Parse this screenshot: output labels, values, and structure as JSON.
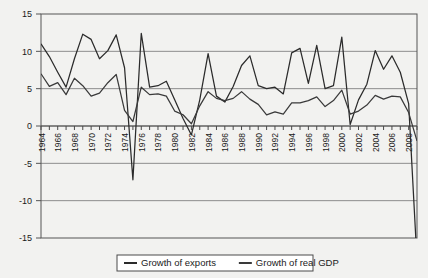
{
  "chart_data": {
    "type": "line",
    "title": "",
    "xlabel": "",
    "ylabel": "",
    "ylim": [
      -15,
      15
    ],
    "xlim": [
      1964,
      2009
    ],
    "grid": true,
    "legend_position": "bottom",
    "y_ticks": [
      "15",
      "10",
      "5",
      "0",
      "-5",
      "-10",
      "-15"
    ],
    "y_tick_values": [
      15,
      10,
      5,
      0,
      -5,
      -10,
      -15
    ],
    "x_tick_labels": [
      "1964",
      "1966",
      "1968",
      "1970",
      "1972",
      "1974",
      "1976",
      "1978",
      "1980",
      "1982",
      "1984",
      "1986",
      "1988",
      "1990",
      "1992",
      "1994",
      "1996",
      "1998",
      "2000",
      "2002",
      "2004",
      "2006",
      "2008"
    ],
    "x": [
      1964,
      1965,
      1966,
      1967,
      1968,
      1969,
      1970,
      1971,
      1972,
      1973,
      1974,
      1975,
      1976,
      1977,
      1978,
      1979,
      1980,
      1981,
      1982,
      1983,
      1984,
      1985,
      1986,
      1987,
      1988,
      1989,
      1990,
      1991,
      1992,
      1993,
      1994,
      1995,
      1996,
      1997,
      1998,
      1999,
      2000,
      2001,
      2002,
      2003,
      2004,
      2005,
      2006,
      2007,
      2008,
      2009
    ],
    "series": [
      {
        "name": "Growth of exports",
        "color": "#2b2b2b",
        "values": [
          11.0,
          9.3,
          7.2,
          5.2,
          9.0,
          12.3,
          11.6,
          9.0,
          10.1,
          12.2,
          7.8,
          -7.2,
          12.4,
          5.2,
          5.4,
          6.0,
          3.5,
          1.0,
          -1.2,
          3.5,
          9.7,
          4.0,
          3.2,
          5.3,
          8.1,
          9.4,
          5.4,
          5.0,
          5.2,
          4.3,
          9.8,
          10.4,
          5.7,
          10.8,
          5.0,
          5.4,
          11.9,
          0.2,
          3.5,
          5.6,
          10.1,
          7.6,
          9.4,
          7.2,
          3.0,
          -18.0
        ]
      },
      {
        "name": "Growth of real GDP",
        "color": "#3a3a3a",
        "values": [
          7.0,
          5.3,
          5.8,
          4.2,
          6.4,
          5.4,
          4.0,
          4.4,
          5.8,
          6.9,
          2.1,
          0.6,
          5.2,
          4.2,
          4.3,
          4.0,
          2.0,
          1.5,
          0.3,
          2.7,
          4.6,
          3.7,
          3.4,
          3.7,
          4.6,
          3.6,
          2.9,
          1.5,
          1.9,
          1.6,
          3.1,
          3.1,
          3.4,
          3.9,
          2.6,
          3.4,
          4.8,
          1.6,
          2.0,
          2.8,
          4.1,
          3.6,
          4.0,
          3.9,
          1.8,
          -2.0
        ]
      }
    ]
  },
  "legend": {
    "items": [
      {
        "label": "Growth of exports"
      },
      {
        "label": "Growth of real GDP"
      }
    ]
  }
}
